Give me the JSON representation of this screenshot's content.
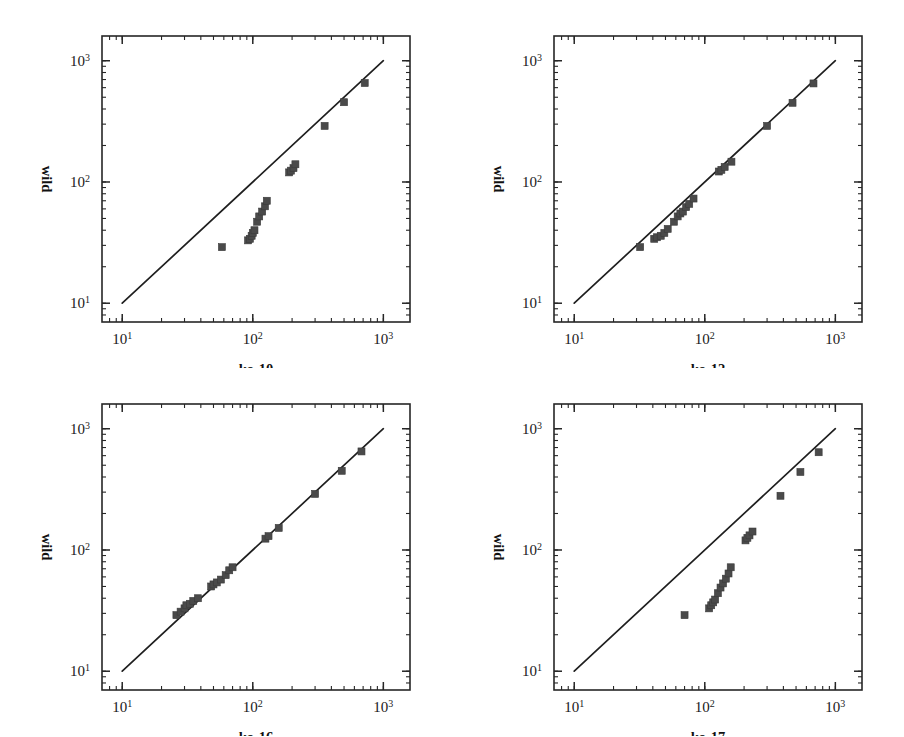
{
  "figure": {
    "panel_count": 4,
    "background_color": "#ffffff",
    "marker_color": "#4a4a4a",
    "line_color": "#1f1f1f"
  },
  "chart_data": [
    {
      "type": "scatter",
      "title": "",
      "xlabel": "ko-10",
      "ylabel": "wild",
      "xscale": "log",
      "yscale": "log",
      "xlim": [
        7,
        1600
      ],
      "ylim": [
        7,
        1600
      ],
      "xticks": [
        10,
        100,
        1000
      ],
      "xticklabels": [
        "10^1",
        "10^2",
        "10^3"
      ],
      "yticks": [
        10,
        100,
        1000
      ],
      "yticklabels": [
        "10^1",
        "10^2",
        "10^3"
      ],
      "grid": false,
      "legend": "none",
      "reference_line": {
        "label": "y = x identity line",
        "from": [
          10,
          10
        ],
        "to": [
          1000,
          1000
        ]
      },
      "x": [
        58,
        92,
        95,
        98,
        100,
        103,
        108,
        112,
        118,
        124,
        128,
        190,
        196,
        205,
        212,
        355,
        500,
        720
      ],
      "y": [
        29,
        33,
        34,
        36,
        38,
        40,
        47,
        52,
        57,
        63,
        70,
        120,
        124,
        130,
        140,
        290,
        455,
        655
      ]
    },
    {
      "type": "scatter",
      "title": "",
      "xlabel": "ko-12",
      "ylabel": "wild",
      "xscale": "log",
      "yscale": "log",
      "xlim": [
        7,
        1600
      ],
      "ylim": [
        7,
        1600
      ],
      "xticks": [
        10,
        100,
        1000
      ],
      "xticklabels": [
        "10^1",
        "10^2",
        "10^3"
      ],
      "yticks": [
        10,
        100,
        1000
      ],
      "yticklabels": [
        "10^1",
        "10^2",
        "10^3"
      ],
      "grid": false,
      "legend": "none",
      "reference_line": {
        "label": "y = x identity line",
        "from": [
          10,
          10
        ],
        "to": [
          1000,
          1000
        ]
      },
      "x": [
        32,
        41,
        43,
        46,
        49,
        52,
        58,
        62,
        65,
        68,
        72,
        76,
        82,
        128,
        134,
        142,
        160,
        300,
        470,
        680
      ],
      "y": [
        29,
        34,
        35,
        36,
        38,
        41,
        47,
        52,
        55,
        57,
        62,
        66,
        73,
        122,
        126,
        133,
        147,
        290,
        450,
        650
      ]
    },
    {
      "type": "scatter",
      "title": "",
      "xlabel": "ko-16",
      "ylabel": "wild",
      "xscale": "log",
      "yscale": "log",
      "xlim": [
        7,
        1600
      ],
      "ylim": [
        7,
        1600
      ],
      "xticks": [
        10,
        100,
        1000
      ],
      "xticklabels": [
        "10^1",
        "10^2",
        "10^3"
      ],
      "yticks": [
        10,
        100,
        1000
      ],
      "yticklabels": [
        "10^1",
        "10^2",
        "10^3"
      ],
      "grid": false,
      "legend": "none",
      "reference_line": {
        "label": "y = x identity line",
        "from": [
          10,
          10
        ],
        "to": [
          1000,
          1000
        ]
      },
      "x": [
        26,
        28,
        30,
        31,
        33,
        35,
        38,
        48,
        50,
        53,
        57,
        62,
        66,
        70,
        125,
        132,
        158,
        300,
        480,
        680
      ],
      "y": [
        29,
        31,
        33,
        35,
        36,
        38,
        40,
        50,
        52,
        54,
        57,
        62,
        68,
        72,
        124,
        130,
        152,
        290,
        450,
        650
      ]
    },
    {
      "type": "scatter",
      "title": "",
      "xlabel": "ko-17",
      "ylabel": "wild",
      "xscale": "log",
      "yscale": "log",
      "xlim": [
        7,
        1600
      ],
      "ylim": [
        7,
        1600
      ],
      "xticks": [
        10,
        100,
        1000
      ],
      "xticklabels": [
        "10^1",
        "10^2",
        "10^3"
      ],
      "yticks": [
        10,
        100,
        1000
      ],
      "yticklabels": [
        "10^1",
        "10^2",
        "10^3"
      ],
      "grid": false,
      "legend": "none",
      "reference_line": {
        "label": "y = x identity line",
        "from": [
          10,
          10
        ],
        "to": [
          1000,
          1000
        ]
      },
      "x": [
        70,
        108,
        112,
        116,
        120,
        126,
        132,
        138,
        145,
        152,
        158,
        205,
        212,
        220,
        232,
        380,
        540,
        745
      ],
      "y": [
        29,
        33,
        35,
        37,
        39,
        44,
        49,
        53,
        58,
        64,
        72,
        120,
        126,
        132,
        142,
        280,
        440,
        640
      ]
    }
  ],
  "panels": [
    {
      "id": "ko-10",
      "xlabel": "ko-10",
      "ylabel": "wild"
    },
    {
      "id": "ko-12",
      "xlabel": "ko-12",
      "ylabel": "wild"
    },
    {
      "id": "ko-16",
      "xlabel": "ko-16",
      "ylabel": "wild"
    },
    {
      "id": "ko-17",
      "xlabel": "ko-17",
      "ylabel": "wild"
    }
  ]
}
